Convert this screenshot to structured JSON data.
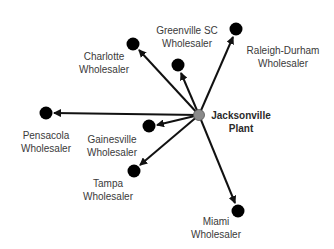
{
  "diagram": {
    "type": "distribution-network",
    "source": {
      "id": "plant",
      "line1": "Jacksonville",
      "line2": "Plant",
      "x": 199,
      "y": 115,
      "color": "#8a8a8a"
    },
    "nodes": [
      {
        "id": "charlotte",
        "line1": "Charlotte",
        "line2": "Wholesaler",
        "x": 133,
        "y": 44
      },
      {
        "id": "greenville",
        "line1": "Greenville SC",
        "line2": "Wholesaler",
        "x": 178,
        "y": 65
      },
      {
        "id": "raleigh",
        "line1": "Raleigh-Durham",
        "line2": "Wholesaler",
        "x": 236,
        "y": 29
      },
      {
        "id": "pensacola",
        "line1": "Pensacola",
        "line2": "Wholesaler",
        "x": 46,
        "y": 113
      },
      {
        "id": "gainesville",
        "line1": "Gainesville",
        "line2": "Wholesaler",
        "x": 149,
        "y": 126
      },
      {
        "id": "tampa",
        "line1": "Tampa",
        "line2": "Wholesaler",
        "x": 134,
        "y": 171
      },
      {
        "id": "miami",
        "line1": "Miami",
        "line2": "Wholesaler",
        "x": 238,
        "y": 211
      }
    ],
    "edges": [
      {
        "from": "plant",
        "to": "charlotte"
      },
      {
        "from": "plant",
        "to": "greenville"
      },
      {
        "from": "plant",
        "to": "raleigh"
      },
      {
        "from": "plant",
        "to": "pensacola"
      },
      {
        "from": "plant",
        "to": "gainesville"
      },
      {
        "from": "plant",
        "to": "tampa"
      },
      {
        "from": "plant",
        "to": "miami"
      }
    ]
  }
}
